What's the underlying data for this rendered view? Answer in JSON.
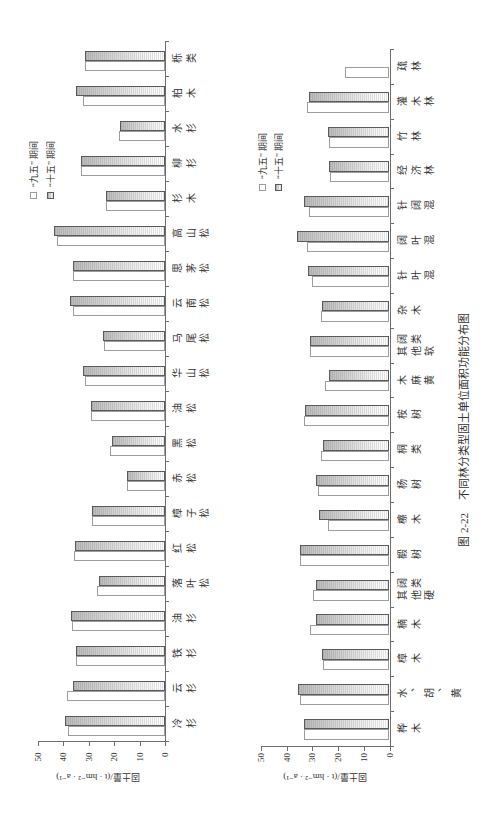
{
  "figure": {
    "caption": {
      "number": "图 2-22",
      "title": "不同林分类型固土单位面积功能分布图"
    }
  },
  "colors": {
    "axis": "#6e6e6e",
    "series_1_fill": "#ffffff",
    "series_1_border": "#9c9c9c",
    "series_2_fill_dark": "#bcbcbc",
    "series_2_fill_light": "#ffffff",
    "series_2_border": "#5a5a5a"
  },
  "chart_data": [
    {
      "type": "bar",
      "title": "",
      "xlabel": "",
      "ylabel": "固土量/(t · hm⁻² · a⁻¹)",
      "ylim": [
        0,
        50
      ],
      "yticks": [
        0,
        10,
        20,
        30,
        40,
        50
      ],
      "grid": false,
      "legend_position": "upper right",
      "categories": [
        "冷杉",
        "云杉",
        "铁杉",
        "油杉",
        "落叶松",
        "红松",
        "樟子松",
        "赤松",
        "黑松",
        "油松",
        "华山松",
        "马尾松",
        "云南松",
        "思茅松",
        "高山松",
        "杉木",
        "柳杉",
        "水杉",
        "柏木",
        "栎类"
      ],
      "series": [
        {
          "name": "“九五” 期间",
          "style": "plain",
          "values": [
            38.0,
            38.5,
            34.9,
            36.6,
            26.8,
            35.8,
            28.7,
            14.9,
            21.7,
            29.2,
            31.5,
            24.0,
            36.4,
            36.2,
            42.6,
            23.3,
            32.9,
            18.2,
            32.3,
            31.4
          ]
        },
        {
          "name": "“十五” 期间",
          "style": "hatched",
          "values": [
            39.2,
            36.2,
            35.2,
            37.0,
            26.0,
            35.5,
            28.7,
            15.0,
            20.9,
            29.1,
            32.3,
            24.4,
            37.4,
            36.2,
            43.8,
            23.2,
            33.2,
            17.7,
            34.9,
            31.6
          ]
        }
      ]
    },
    {
      "type": "bar",
      "title": "",
      "xlabel": "",
      "ylabel": "固土量/(t · hm⁻² · a⁻¹)",
      "ylim": [
        0,
        50
      ],
      "yticks": [
        0,
        10,
        20,
        30,
        40,
        50
      ],
      "grid": false,
      "legend_position": "upper right",
      "categories": [
        "桦木",
        "水、胡、黄",
        "樟木",
        "楠木",
        "其他硬阔类",
        "椴树",
        "檫木",
        "杨树",
        "桐类",
        "桉树",
        "木麻黄",
        "其他软阔类",
        "杂木",
        "针叶混",
        "阔叶混",
        "针阔混",
        "经济林",
        "竹林",
        "灌木林",
        "疏林"
      ],
      "series": [
        {
          "name": "“九五” 期间",
          "style": "plain",
          "values": [
            33.3,
            34.8,
            25.9,
            30.9,
            29.8,
            34.7,
            23.9,
            27.9,
            26.6,
            33.1,
            25.1,
            30.9,
            26.5,
            30.2,
            32.2,
            31.3,
            23.1,
            23.5,
            32.1,
            17.4
          ]
        },
        {
          "name": "“十五” 期间",
          "style": "hatched",
          "values": [
            33.3,
            35.5,
            26.3,
            28.6,
            28.6,
            34.8,
            27.4,
            28.7,
            26.0,
            32.7,
            23.6,
            30.9,
            26.3,
            31.7,
            35.9,
            33.3,
            23.5,
            23.9,
            31.3,
            null
          ]
        }
      ]
    }
  ]
}
